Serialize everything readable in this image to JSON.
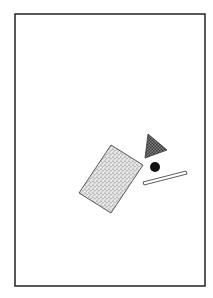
{
  "canvas": {
    "width": 213,
    "height": 298,
    "background": "#ffffff"
  },
  "frame": {
    "x": 15,
    "y": 14,
    "width": 190,
    "height": 272,
    "stroke": "#222222"
  },
  "shapes": {
    "rectangle": {
      "points": "111,145 143,165 111,213 79,193",
      "fill": "stippled-gray",
      "stroke": "#333333"
    },
    "triangle": {
      "points": "148,134 167,150 145,158",
      "fill": "crosshatch-dark",
      "stroke": "#333333"
    },
    "circle": {
      "cx": 155,
      "cy": 167,
      "r": 5,
      "fill": "#111111"
    },
    "bar": {
      "points": "143,182 186,171 187,174 144,185",
      "fill": "#ffffff",
      "stroke": "#333333"
    }
  }
}
